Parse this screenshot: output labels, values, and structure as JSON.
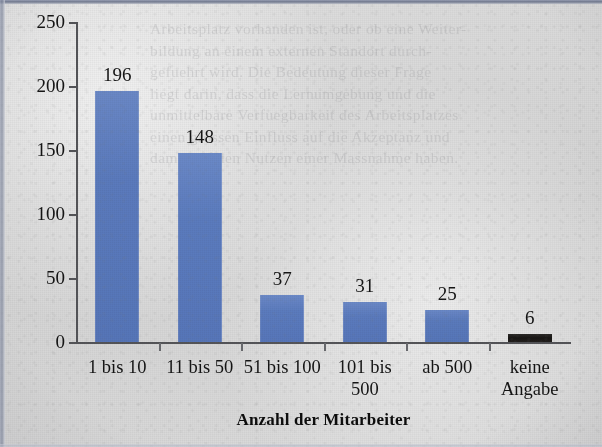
{
  "document": {
    "kind": "scanned-page-bar-chart",
    "background_text_lines": [
      "Arbeitsplatz vorhanden ist, oder ob eine Weiter-",
      "bildung an einem externen Standort durch-",
      "gefuehrt wird. Die Bedeutung dieser Frage",
      "liegt darin, dass die Lernumgebung und die",
      "unmittelbare Verfuegbarkeit des Arbeitsplatzes",
      "einen grossen Einfluss auf die Akzeptanz und",
      "damit auf den Nutzen einer Massnahme haben."
    ]
  },
  "chart_data": {
    "type": "bar",
    "title": "",
    "xlabel": "Anzahl der Mitarbeiter",
    "ylabel": "Anzahl der Unternehmen",
    "categories": [
      "1 bis 10",
      "11 bis 50",
      "51 bis 100",
      "101 bis 500",
      "ab 500",
      "keine Angabe"
    ],
    "category_lines": [
      [
        "1 bis 10"
      ],
      [
        "11 bis 50"
      ],
      [
        "51 bis 100"
      ],
      [
        "101 bis",
        "500"
      ],
      [
        "ab 500"
      ],
      [
        "keine",
        "Angabe"
      ]
    ],
    "values": [
      196,
      148,
      37,
      31,
      25,
      6
    ],
    "value_labels": [
      "196",
      "148",
      "37",
      "31",
      "25",
      "6"
    ],
    "ylim": [
      0,
      250
    ],
    "yticks": [
      0,
      50,
      100,
      150,
      200,
      250
    ],
    "ytick_labels": [
      "0",
      "50",
      "100",
      "150",
      "200",
      "250"
    ],
    "grid": false,
    "legend": false,
    "bar_colors": [
      "#5878bd",
      "#5878bd",
      "#5878bd",
      "#5878bd",
      "#5878bd",
      "#1a1715"
    ],
    "accent_color": "#5878bd",
    "dark_bar_color": "#1a1715",
    "axis_color": "#55565a",
    "text_color": "#141414",
    "page_color": "#dcdcdc"
  }
}
